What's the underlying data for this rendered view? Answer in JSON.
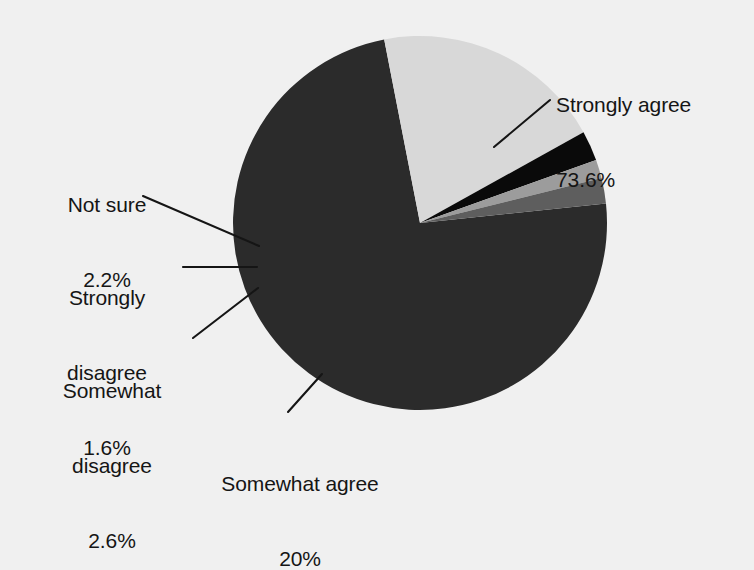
{
  "background_color": "#f0f0f0",
  "chart_data": {
    "type": "pie",
    "title": "",
    "subtitle": "",
    "xlabel": "",
    "ylabel": "",
    "legend_position": "none",
    "grid": false,
    "labels_style": "outside-with-leader-lines",
    "categories": [
      "Strongly agree",
      "Somewhat agree",
      "Somewhat disagree",
      "Strongly disagree",
      "Not sure"
    ],
    "values": [
      73.6,
      20,
      2.6,
      1.6,
      2.2
    ],
    "value_unit": "%",
    "colors": [
      "#2b2b2b",
      "#d8d8d8",
      "#0a0a0a",
      "#9c9c9c",
      "#5e5e5e"
    ],
    "slices": [
      {
        "label": "Strongly agree",
        "value": 73.6,
        "value_text": "73.6%",
        "color": "#2b2b2b"
      },
      {
        "label": "Somewhat agree",
        "value": 20,
        "value_text": "20%",
        "color": "#d8d8d8"
      },
      {
        "label": "Somewhat disagree",
        "value": 2.6,
        "value_text": "2.6%",
        "color": "#0a0a0a"
      },
      {
        "label": "Strongly disagree",
        "value": 1.6,
        "value_text": "1.6%",
        "color": "#9c9c9c"
      },
      {
        "label": "Not sure",
        "value": 2.2,
        "value_text": "2.2%",
        "color": "#5e5e5e"
      }
    ]
  },
  "labels": {
    "strongly_agree": {
      "name": "Strongly agree",
      "value": "73.6%"
    },
    "somewhat_agree": {
      "name": "Somewhat agree",
      "value": "20%"
    },
    "somewhat_disagree": {
      "name_line1": "Somewhat",
      "name_line2": "disagree",
      "value": "2.6%"
    },
    "strongly_disagree": {
      "name_line1": "Strongly",
      "name_line2": "disagree",
      "value": "1.6%"
    },
    "not_sure": {
      "name": "Not sure",
      "value": "2.2%"
    }
  }
}
